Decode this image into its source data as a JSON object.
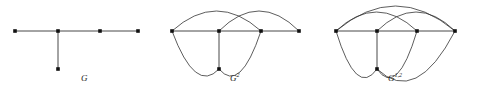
{
  "figure": {
    "type": "graph-diagram-set",
    "background_color": "#ffffff",
    "stroke_color": "#333333",
    "vertex_color": "#111111",
    "panels": [
      {
        "id": "panel-g",
        "caption_base": "G",
        "caption_sup": "",
        "caption_x": 81,
        "caption_y": 74,
        "description": "Tree G: a path on four vertices with one pendant vertex attached to the second vertex",
        "vertices": [
          {
            "name": "v1",
            "x": 15,
            "y": 31
          },
          {
            "name": "v2",
            "x": 58,
            "y": 31
          },
          {
            "name": "v3",
            "x": 100,
            "y": 31
          },
          {
            "name": "v4",
            "x": 138,
            "y": 31
          },
          {
            "name": "v5",
            "x": 58,
            "y": 69
          }
        ],
        "straight_edges": [
          {
            "from": "v1",
            "to": "v2"
          },
          {
            "from": "v2",
            "to": "v3"
          },
          {
            "from": "v3",
            "to": "v4"
          },
          {
            "from": "v2",
            "to": "v5"
          }
        ],
        "arc_edges": []
      },
      {
        "id": "panel-g2",
        "caption_base": "G",
        "caption_sup": "2",
        "caption_x": 230,
        "caption_y": 74,
        "description": "Second power of G: distance-two pairs joined by arcs",
        "vertices": [
          {
            "name": "v1",
            "x": 172,
            "y": 31
          },
          {
            "name": "v2",
            "x": 219,
            "y": 31
          },
          {
            "name": "v3",
            "x": 261,
            "y": 31
          },
          {
            "name": "v4",
            "x": 299,
            "y": 31
          },
          {
            "name": "v5",
            "x": 219,
            "y": 69
          }
        ],
        "straight_edges": [
          {
            "from": "v1",
            "to": "v2"
          },
          {
            "from": "v2",
            "to": "v3"
          },
          {
            "from": "v3",
            "to": "v4"
          },
          {
            "from": "v2",
            "to": "v5"
          }
        ],
        "arc_edges": [
          {
            "from": "v1",
            "to": "v3",
            "side": "top",
            "bulge": 20
          },
          {
            "from": "v2",
            "to": "v4",
            "side": "top",
            "bulge": 20
          },
          {
            "from": "v1",
            "to": "v5",
            "side": "bottom",
            "bulge": 22
          },
          {
            "from": "v3",
            "to": "v5",
            "side": "bottom",
            "bulge": 22
          }
        ]
      },
      {
        "id": "panel-g12",
        "caption_base": "G",
        "caption_sup": "1,2",
        "caption_x": 388,
        "caption_y": 74,
        "description": "Mixed power G^{1,2} of G: additional long arcs spanning the end vertices",
        "vertices": [
          {
            "name": "v1",
            "x": 336,
            "y": 31
          },
          {
            "name": "v2",
            "x": 377,
            "y": 31
          },
          {
            "name": "v3",
            "x": 417,
            "y": 31
          },
          {
            "name": "v4",
            "x": 455,
            "y": 31
          },
          {
            "name": "v5",
            "x": 377,
            "y": 69
          }
        ],
        "straight_edges": [
          {
            "from": "v1",
            "to": "v2"
          },
          {
            "from": "v2",
            "to": "v3"
          },
          {
            "from": "v3",
            "to": "v4"
          },
          {
            "from": "v2",
            "to": "v5"
          }
        ],
        "arc_edges": [
          {
            "from": "v1",
            "to": "v3",
            "side": "top",
            "bulge": 19
          },
          {
            "from": "v2",
            "to": "v4",
            "side": "top",
            "bulge": 19
          },
          {
            "from": "v1",
            "to": "v4",
            "side": "top",
            "bulge": 25
          },
          {
            "from": "v1",
            "to": "v5",
            "side": "bottom",
            "bulge": 24
          },
          {
            "from": "v3",
            "to": "v5",
            "side": "bottom",
            "bulge": 24
          },
          {
            "from": "v4",
            "to": "v5",
            "side": "bottom",
            "bulge": 28
          }
        ]
      }
    ]
  }
}
